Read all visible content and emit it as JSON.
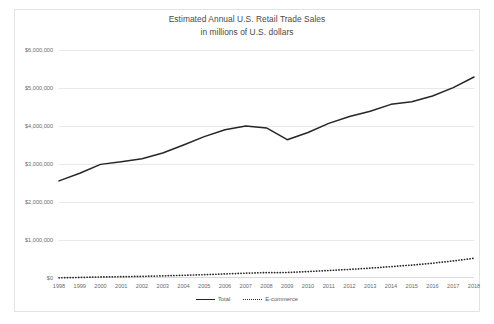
{
  "chart_data": {
    "type": "line",
    "title": "Estimated Annual U.S. Retail Trade Sales",
    "subtitle": "in millions of U.S. dollars",
    "xlabel": "",
    "ylabel": "",
    "grid": true,
    "legend_position": "bottom",
    "ylim": [
      0,
      6000000
    ],
    "ytick_step": 1000000,
    "ytick_labels": [
      "$6,000,000",
      "$5,000,000",
      "$4,000,000",
      "$3,000,000",
      "$2,000,000",
      "$1,000,000",
      "$0"
    ],
    "ytick_values": [
      6000000,
      5000000,
      4000000,
      3000000,
      2000000,
      1000000,
      0
    ],
    "categories": [
      1998,
      1999,
      2000,
      2001,
      2002,
      2003,
      2004,
      2005,
      2006,
      2007,
      2008,
      2009,
      2010,
      2011,
      2012,
      2013,
      2014,
      2015,
      2016,
      2017,
      2018
    ],
    "xtick_labels": [
      "1998",
      "1999",
      "2000",
      "2001",
      "2002",
      "2003",
      "2004",
      "2005",
      "2006",
      "2007",
      "2008",
      "2009",
      "2010",
      "2011",
      "2012",
      "2013",
      "2014",
      "2015",
      "2016",
      "2017",
      "2018"
    ],
    "series": [
      {
        "name": "Total",
        "style": "solid",
        "color": "#262626",
        "values": [
          2556000,
          2755000,
          2990000,
          3060000,
          3140000,
          3290000,
          3500000,
          3720000,
          3900000,
          4000000,
          3950000,
          3640000,
          3830000,
          4070000,
          4250000,
          4390000,
          4570000,
          4640000,
          4790000,
          5010000,
          5290000
        ]
      },
      {
        "name": "E-commerce",
        "style": "dotted",
        "color": "#2b2b2b",
        "values": [
          5000,
          15000,
          27000,
          34000,
          44000,
          56000,
          71000,
          87000,
          107000,
          127000,
          142000,
          145000,
          169000,
          198000,
          226000,
          260000,
          299000,
          341000,
          390000,
          449000,
          519000
        ]
      }
    ]
  },
  "legend": {
    "items": [
      {
        "label": "Total",
        "style": "solid"
      },
      {
        "label": "E-commerce",
        "style": "dotted"
      }
    ]
  }
}
